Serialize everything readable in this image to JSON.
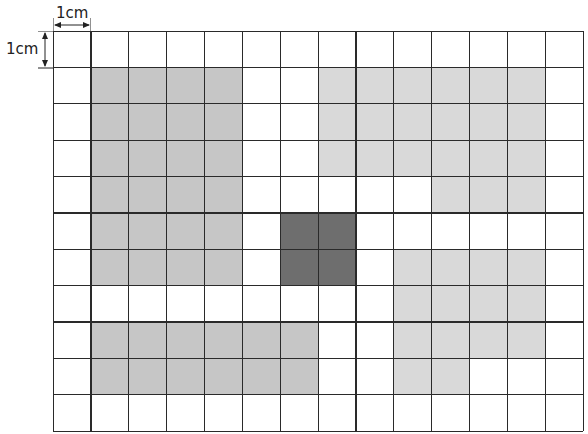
{
  "diagram": {
    "title": "",
    "unit_label_horizontal": "1cm",
    "unit_label_vertical": "1cm",
    "grid": {
      "columns": 14,
      "rows": 11,
      "cell_size_cm": 1
    },
    "colors": {
      "line": "#2a2a2a",
      "background": "#ffffff",
      "region_medium": "#c6c6c6",
      "region_light": "#d9d9d9",
      "region_dark": "#6e6e6e"
    },
    "regions": [
      {
        "name": "left-rectangle",
        "shade": "region_medium",
        "cells": "cols 1-4, rows 1-6",
        "rects": [
          {
            "col": 1,
            "row": 1,
            "w": 4,
            "h": 6
          }
        ]
      },
      {
        "name": "bottom-rectangle",
        "shade": "region_medium",
        "cells": "cols 1-6, rows 8-9",
        "rects": [
          {
            "col": 1,
            "row": 8,
            "w": 6,
            "h": 2
          }
        ]
      },
      {
        "name": "center-dark-square",
        "shade": "region_dark",
        "cells": "cols 6-7, rows 5-6",
        "rects": [
          {
            "col": 6,
            "row": 5,
            "w": 2,
            "h": 2
          }
        ]
      },
      {
        "name": "top-right-shape",
        "shade": "region_light",
        "cells": "cols 7-12 rows 1-3; cols 10-12 row 4",
        "rects": [
          {
            "col": 7,
            "row": 1,
            "w": 6,
            "h": 3
          },
          {
            "col": 10,
            "row": 4,
            "w": 3,
            "h": 1
          }
        ]
      },
      {
        "name": "bottom-right-shape",
        "shade": "region_light",
        "cells": "cols 9-12 rows 6-8; cols 9-10 row 9",
        "rects": [
          {
            "col": 9,
            "row": 6,
            "w": 4,
            "h": 3
          },
          {
            "col": 9,
            "row": 9,
            "w": 2,
            "h": 1
          }
        ]
      }
    ]
  }
}
